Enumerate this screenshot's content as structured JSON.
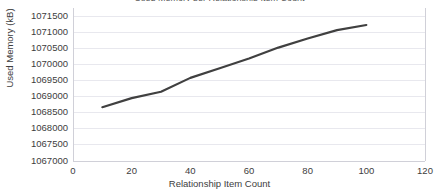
{
  "chart_data": {
    "type": "line",
    "title": "Used Memory per Relationship Item Count",
    "xlabel": "Relationship Item Count",
    "ylabel": "Used Memory (kB)",
    "xlim": [
      0,
      120
    ],
    "ylim": [
      1067000,
      1071500
    ],
    "xticks": [
      0,
      20,
      40,
      60,
      80,
      100,
      120
    ],
    "xtick_labels": [
      "0",
      "20",
      "40",
      "60",
      "80",
      "100",
      "120"
    ],
    "yticks": [
      1067000,
      1067500,
      1068000,
      1068500,
      1069000,
      1069500,
      1070000,
      1070500,
      1071000,
      1071500
    ],
    "ytick_labels": [
      "1067000",
      "1067500",
      "1068000",
      "1068500",
      "1069000",
      "1069500",
      "1070000",
      "1070500",
      "1071000",
      "1071500"
    ],
    "grid": true,
    "grid_axis": "y",
    "legend": false,
    "legend_position": "none",
    "line_color": "#404040",
    "grid_color": "#e8e8ee",
    "axis_color": "#d0d0d8",
    "background": "#ffffff",
    "series": [
      {
        "name": "Used Memory (kB)",
        "x": [
          10,
          20,
          30,
          40,
          50,
          60,
          70,
          80,
          90,
          100
        ],
        "values": [
          1068670,
          1068950,
          1069150,
          1069580,
          1069880,
          1070180,
          1070520,
          1070800,
          1071060,
          1071220
        ]
      }
    ]
  }
}
